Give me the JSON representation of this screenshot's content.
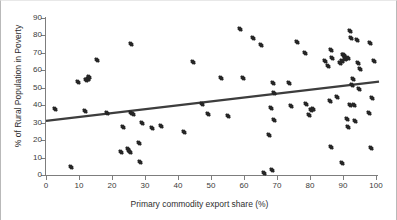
{
  "chart_data": {
    "type": "scatter",
    "title": "",
    "xlabel": "Primary commodity export share (%)",
    "ylabel": "% of Rural Population in Poverty",
    "xlim": [
      0,
      100
    ],
    "ylim": [
      0,
      90
    ],
    "xticks": [
      0,
      10,
      20,
      30,
      40,
      50,
      60,
      70,
      80,
      90,
      100
    ],
    "yticks": [
      0,
      10,
      20,
      30,
      40,
      50,
      60,
      70,
      80,
      90
    ],
    "grid": false,
    "legend": null,
    "marker": "diamond",
    "marker_color": "#262626",
    "trendline": {
      "type": "linear",
      "color": "#3d3d3d",
      "x_start": 0,
      "y_start": 31.0,
      "x_end": 100,
      "y_end": 53.5
    },
    "points": [
      [
        2.6,
        37.7
      ],
      [
        7.6,
        4.6
      ],
      [
        9.8,
        53.2
      ],
      [
        11.8,
        36.7
      ],
      [
        12.2,
        54.5
      ],
      [
        12.7,
        55.3
      ],
      [
        13.0,
        56.0
      ],
      [
        15.6,
        65.9
      ],
      [
        18.5,
        35.4
      ],
      [
        22.8,
        13.4
      ],
      [
        23.2,
        27.7
      ],
      [
        24.8,
        15.0
      ],
      [
        25.2,
        13.9
      ],
      [
        25.4,
        13.3
      ],
      [
        25.7,
        74.9
      ],
      [
        25.9,
        35.5
      ],
      [
        26.3,
        34.8
      ],
      [
        28.3,
        18.3
      ],
      [
        28.6,
        7.5
      ],
      [
        29.1,
        29.8
      ],
      [
        32.2,
        27.1
      ],
      [
        34.9,
        28.2
      ],
      [
        41.7,
        24.6
      ],
      [
        44.4,
        64.7
      ],
      [
        47.2,
        40.7
      ],
      [
        49.2,
        35.0
      ],
      [
        53.0,
        55.5
      ],
      [
        55.0,
        33.8
      ],
      [
        58.9,
        83.5
      ],
      [
        59.6,
        55.4
      ],
      [
        62.8,
        78.6
      ],
      [
        65.3,
        74.4
      ],
      [
        66.2,
        0.9
      ],
      [
        67.5,
        22.9
      ],
      [
        68.2,
        38.5
      ],
      [
        68.6,
        3.0
      ],
      [
        68.8,
        52.8
      ],
      [
        69.0,
        46.8
      ],
      [
        69.1,
        31.7
      ],
      [
        73.6,
        52.7
      ],
      [
        74.3,
        39.4
      ],
      [
        76.1,
        76.2
      ],
      [
        78.4,
        70.2
      ],
      [
        78.7,
        40.7
      ],
      [
        79.8,
        34.5
      ],
      [
        80.3,
        37.5
      ],
      [
        81.0,
        38.0
      ],
      [
        84.4,
        65.5
      ],
      [
        85.6,
        62.6
      ],
      [
        86.2,
        42.5
      ],
      [
        86.3,
        71.8
      ],
      [
        86.5,
        16.1
      ],
      [
        86.7,
        66.8
      ],
      [
        88.1,
        44.5
      ],
      [
        89.2,
        64.2
      ],
      [
        89.6,
        65.5
      ],
      [
        89.8,
        6.8
      ],
      [
        90.1,
        68.7
      ],
      [
        90.4,
        69.0
      ],
      [
        90.6,
        66.3
      ],
      [
        90.9,
        67.3
      ],
      [
        91.2,
        32.2
      ],
      [
        91.4,
        66.9
      ],
      [
        91.5,
        27.6
      ],
      [
        92.0,
        82.8
      ],
      [
        92.2,
        40.3
      ],
      [
        92.5,
        78.6
      ],
      [
        92.6,
        51.7
      ],
      [
        93.0,
        55.0
      ],
      [
        93.3,
        40.3
      ],
      [
        93.5,
        30.8
      ],
      [
        94.1,
        77.6
      ],
      [
        94.4,
        64.0
      ],
      [
        94.8,
        49.2
      ],
      [
        95.3,
        60.8
      ],
      [
        97.8,
        35.5
      ],
      [
        98.3,
        75.4
      ],
      [
        98.5,
        15.7
      ],
      [
        98.7,
        44.4
      ],
      [
        99.5,
        65.2
      ]
    ]
  }
}
